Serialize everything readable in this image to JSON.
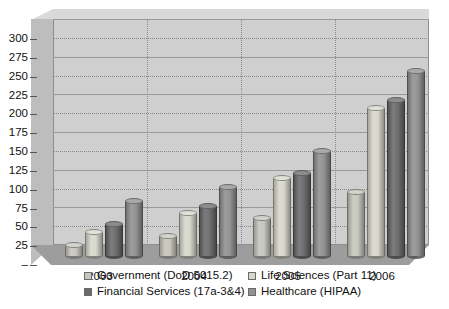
{
  "chart_data": {
    "type": "bar",
    "title": "",
    "subtitle": "",
    "xlabel": "",
    "ylabel": "",
    "categories": [
      "2003",
      "2004",
      "2005",
      "2006"
    ],
    "ylim": [
      0,
      300
    ],
    "ytick_step": 25,
    "ytick_labels": [
      "300",
      "275",
      "250",
      "225",
      "200",
      "175",
      "150",
      "125",
      "100",
      "75",
      "50",
      "25",
      "–"
    ],
    "ytick_values": [
      300,
      275,
      250,
      225,
      200,
      175,
      150,
      125,
      100,
      75,
      50,
      25,
      0
    ],
    "grid": true,
    "legend_position": "bottom",
    "style": "3d-cylinder",
    "series": [
      {
        "name": "Government (DoD 5015.2)",
        "color": "#c6c6bd",
        "values": [
          15,
          27,
          50,
          85
        ]
      },
      {
        "name": "Life Sciences (Part 11)",
        "color": "#d7d7cc",
        "values": [
          32,
          57,
          103,
          197
        ]
      },
      {
        "name": "Financial Services (17a-3&4)",
        "color": "#6b6b6b",
        "values": [
          42,
          67,
          110,
          207
        ]
      },
      {
        "name": "Healthcare (HIPAA)",
        "color": "#919191",
        "values": [
          73,
          92,
          140,
          245
        ]
      }
    ]
  },
  "axis": {
    "tick_0": "300",
    "tick_1": "275",
    "tick_2": "250",
    "tick_3": "225",
    "tick_4": "200",
    "tick_5": "175",
    "tick_6": "150",
    "tick_7": "125",
    "tick_8": "100",
    "tick_9": "75",
    "tick_10": "50",
    "tick_11": "25",
    "tick_12": "–"
  },
  "x_axis": {
    "label_0": "2003",
    "label_1": "2004",
    "label_2": "2005",
    "label_3": "2006"
  },
  "legend": {
    "item_0": "Government (DoD 5015.2)",
    "item_1": "Life Sciences (Part 11)",
    "item_2": "Financial Services (17a-3&4)",
    "item_3": "Healthcare (HIPAA)"
  },
  "colors": {
    "plot_background": "#cfcfcf",
    "floor": "#9d9d9d",
    "wall": "#bdbdbd",
    "gridline": "#8a8a8a",
    "page_background": "#ffffff",
    "text": "#111111"
  }
}
